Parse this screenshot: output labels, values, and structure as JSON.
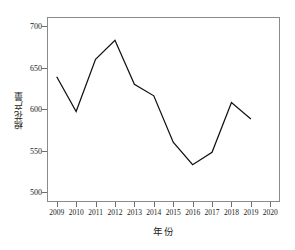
{
  "chart_data": {
    "type": "line",
    "title": "",
    "subtitle": "",
    "xlabel": "年份",
    "ylabel": "棉花产量",
    "x": [
      2009,
      2010,
      2011,
      2012,
      2013,
      2014,
      2015,
      2016,
      2017,
      2018,
      2019
    ],
    "values": [
      639,
      597,
      660,
      683,
      630,
      616,
      560,
      533,
      548,
      608,
      588
    ],
    "series": [
      {
        "name": "棉花产量",
        "x": [
          2009,
          2010,
          2011,
          2012,
          2013,
          2014,
          2015,
          2016,
          2017,
          2018,
          2019
        ],
        "values": [
          639,
          597,
          660,
          683,
          630,
          616,
          560,
          533,
          548,
          608,
          588
        ]
      }
    ],
    "xtick_labels": [
      "2009",
      "2010",
      "2011",
      "2012",
      "2013",
      "2014",
      "2015",
      "2016",
      "2017",
      "2018",
      "2019",
      "2020"
    ],
    "xtick_values": [
      2009,
      2010,
      2011,
      2012,
      2013,
      2014,
      2015,
      2016,
      2017,
      2018,
      2019,
      2020
    ],
    "ytick_labels": [
      "500",
      "550",
      "600",
      "650",
      "700"
    ],
    "ytick_values": [
      500,
      550,
      600,
      650,
      700
    ],
    "xlim": [
      2008.5,
      2020.5
    ],
    "ylim": [
      488,
      711
    ],
    "grid": false,
    "legend": false,
    "legend_position": "none",
    "line_color": "#111111",
    "frame_color": "#8a8a8a",
    "background_color": "#ffffff",
    "markers": false,
    "annotations": []
  }
}
